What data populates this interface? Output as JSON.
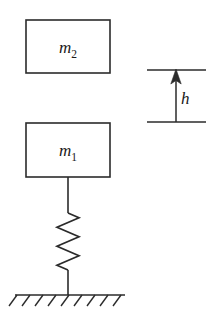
{
  "figure": {
    "background_color": "#ffffff",
    "stroke_color": "#2b2b2b",
    "width": 221,
    "height": 317
  },
  "masses": [
    {
      "id": "m2",
      "symbol": "m",
      "subscript": "2",
      "label": "m2",
      "box": {
        "x": 26,
        "y": 20,
        "width": 84,
        "height": 53
      },
      "role": "falling-mass"
    },
    {
      "id": "m1",
      "symbol": "m",
      "subscript": "1",
      "label": "m1",
      "box": {
        "x": 26,
        "y": 123,
        "width": 84,
        "height": 54
      },
      "role": "supported-mass"
    }
  ],
  "spring": {
    "name": "coil-spring",
    "top_y": 177,
    "bottom_y": 295,
    "center_x": 68,
    "coil_top_y": 213,
    "coil_bottom_y": 270,
    "coils": 6,
    "amplitude": 11
  },
  "ground": {
    "name": "fixed-ground",
    "line_y": 295,
    "x_start": 15,
    "x_end": 125,
    "hatch_count": 9,
    "hatch_length": 13
  },
  "dimension": {
    "name": "drop-height",
    "label": "h",
    "top_line_y": 70,
    "bottom_line_y": 122,
    "line_x_start": 147,
    "line_x_end": 206,
    "arrow_x": 176,
    "arrow_direction": "up",
    "label_position": {
      "x": 181,
      "y": 103
    }
  }
}
